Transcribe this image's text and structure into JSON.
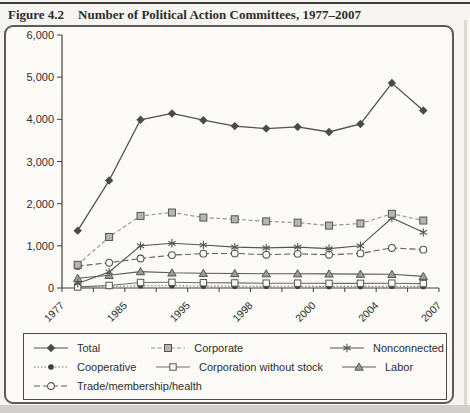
{
  "figure": {
    "label": "Figure 4.2",
    "caption": "Number of Political Action Committees, 1977–2007"
  },
  "chart_data": {
    "type": "line",
    "title": "Number of Political Action Committees, 1977–2007",
    "xlabel": "",
    "ylabel": "",
    "ylim": [
      0,
      6000
    ],
    "grid": false,
    "y_tick_labels": [
      "0",
      "1,000",
      "2,000",
      "3,000",
      "4,000",
      "5,000",
      "6,000"
    ],
    "x_tick_labels": [
      "1977",
      "",
      "1985",
      "",
      "1995",
      "",
      "1998",
      "",
      "2000",
      "",
      "2004",
      "",
      "2007"
    ],
    "points_between_ticks": true,
    "legend_position": "bottom-box",
    "series": [
      {
        "name": "Total",
        "marker": "diamond-filled",
        "line": "solid",
        "color": "#4f4f4f",
        "values": [
          1360,
          2550,
          3990,
          4140,
          3980,
          3840,
          3780,
          3820,
          3700,
          3890,
          4860,
          4210
        ]
      },
      {
        "name": "Corporate",
        "marker": "square-gray",
        "line": "dashed",
        "color": "#8f8f8f",
        "values": [
          550,
          1210,
          1710,
          1790,
          1670,
          1630,
          1580,
          1550,
          1480,
          1530,
          1760,
          1600
        ]
      },
      {
        "name": "Nonconnected",
        "marker": "asterisk",
        "line": "solid",
        "color": "#555555",
        "values": [
          110,
          380,
          1000,
          1060,
          1020,
          970,
          950,
          970,
          935,
          1000,
          1660,
          1320
        ]
      },
      {
        "name": "Cooperative",
        "marker": "circle-filled",
        "line": "dotted",
        "color": "#7a7a7a",
        "values": [
          10,
          35,
          55,
          55,
          45,
          42,
          40,
          40,
          38,
          38,
          40,
          38
        ]
      },
      {
        "name": "Corporation without stock",
        "marker": "square-open",
        "line": "solid",
        "color": "#6e6e6e",
        "values": [
          25,
          60,
          130,
          135,
          125,
          120,
          115,
          115,
          110,
          110,
          115,
          105
        ]
      },
      {
        "name": "Labor",
        "marker": "triangle-filled",
        "line": "solid",
        "color": "#5a5a5a",
        "values": [
          230,
          300,
          390,
          360,
          350,
          345,
          340,
          340,
          335,
          330,
          325,
          275
        ]
      },
      {
        "name": "Trade/membership/health",
        "marker": "circle-open",
        "line": "dashed-long",
        "color": "#606060",
        "values": [
          520,
          600,
          700,
          780,
          815,
          820,
          790,
          810,
          790,
          820,
          950,
          910
        ]
      }
    ],
    "draw_order": [
      "Cooperative",
      "Corporation without stock",
      "Labor",
      "Trade/membership/health",
      "Nonconnected",
      "Corporate",
      "Total"
    ],
    "legend_rows": [
      [
        "Total",
        "Corporate",
        "Nonconnected"
      ],
      [
        "Cooperative",
        "Corporation without stock",
        "Labor"
      ],
      [
        "Trade/membership/health"
      ]
    ]
  },
  "colors": {
    "page_bg": "#f7f5f1",
    "frame_bg": "#fbfaf7",
    "frame_border": "#5a5a5a",
    "axis": "#3f3f3f",
    "text": "#2e2e2e",
    "marker_gray_fill": "#b5b5b5",
    "page_edge": "#d2cfca"
  }
}
